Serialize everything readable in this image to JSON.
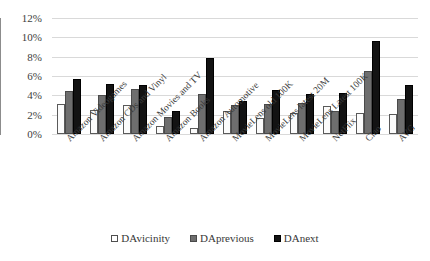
{
  "chart_data": {
    "type": "bar",
    "title": "",
    "xlabel": "",
    "ylabel": "",
    "ylim": [
      0,
      12
    ],
    "ytick_labels": [
      "0%",
      "2%",
      "4%",
      "6%",
      "8%",
      "10%",
      "12%"
    ],
    "ytick_values": [
      0,
      2,
      4,
      6,
      8,
      10,
      12
    ],
    "grid": true,
    "legend_position": "bottom",
    "categories": [
      "Amazon Videogames",
      "Amazon CDs and Vinyl",
      "Amazon Movies and TV",
      "Amazon Books",
      "Amazon Automotive",
      "MovieLens old 100K",
      "MovieLens latest 20M",
      "MovieLens Latest 100K",
      "NetFlix",
      "Ciao",
      "AVG"
    ],
    "series": [
      {
        "name": "DAvicinity",
        "color": "#ffffff",
        "values": [
          3.1,
          2.5,
          3.0,
          0.8,
          0.6,
          2.4,
          1.7,
          2.2,
          2.9,
          2.2,
          2.1
        ]
      },
      {
        "name": "DAprevious",
        "color": "#6e6e6e",
        "values": [
          4.5,
          4.0,
          4.7,
          1.8,
          4.1,
          3.0,
          3.1,
          3.2,
          2.4,
          6.5,
          3.6
        ]
      },
      {
        "name": "DAnext",
        "color": "#131313",
        "values": [
          5.7,
          5.2,
          5.1,
          2.4,
          7.9,
          3.4,
          4.6,
          4.1,
          4.2,
          9.6,
          5.1
        ]
      }
    ]
  },
  "legend": {
    "items": [
      {
        "label": "DAvicinity"
      },
      {
        "label": "DAprevious"
      },
      {
        "label": "DAnext"
      }
    ]
  }
}
